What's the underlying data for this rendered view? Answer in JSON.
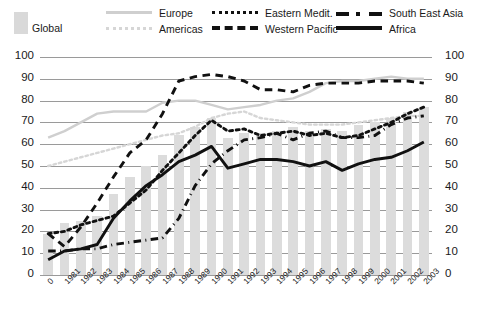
{
  "legend": {
    "global_label": "Global",
    "entries": [
      {
        "name": "Europe",
        "style": "solid-lightgray",
        "color": "#cfcfcf"
      },
      {
        "name": "Eastern Medit.",
        "style": "dotted-black",
        "color": "#111111"
      },
      {
        "name": "South East Asia",
        "style": "dash-dot-black",
        "color": "#111111"
      },
      {
        "name": "Americas",
        "style": "dotted-lightgray",
        "color": "#d6d6d6"
      },
      {
        "name": "Western Pacific",
        "style": "dashed-black",
        "color": "#111111"
      },
      {
        "name": "Africa",
        "style": "solid-black",
        "color": "#111111"
      }
    ]
  },
  "axis": {
    "y_ticks": [
      "100",
      "90",
      "80",
      "70",
      "60",
      "50",
      "40",
      "30",
      "20",
      "10",
      "0"
    ],
    "y_ticks_right": [
      "100",
      "90",
      "80",
      "70",
      "60",
      "50",
      "40",
      "30",
      "20",
      "10",
      "0"
    ],
    "x_ticks": [
      "0",
      "1981",
      "1982",
      "1983",
      "1984",
      "1985",
      "1986",
      "1987",
      "1988",
      "1989",
      "1990",
      "1991",
      "1992",
      "1993",
      "1994",
      "1995",
      "1996",
      "1997",
      "1998",
      "1999",
      "2000",
      "2001",
      "2002",
      "2003"
    ]
  },
  "chart_data": {
    "type": "bar",
    "title": "",
    "subtitle": "",
    "xlabel": "",
    "ylabel": "",
    "ylim": [
      0,
      100
    ],
    "grid": true,
    "legend_position": "top",
    "categories": [
      "1980",
      "1981",
      "1982",
      "1983",
      "1984",
      "1985",
      "1986",
      "1987",
      "1988",
      "1989",
      "1990",
      "1991",
      "1992",
      "1993",
      "1994",
      "1995",
      "1996",
      "1997",
      "1998",
      "1999",
      "2000",
      "2001",
      "2002",
      "2003"
    ],
    "bar_series": {
      "name": "Global",
      "color": "#dcdcdc",
      "values": [
        19,
        24,
        25,
        27,
        37,
        45,
        50,
        55,
        64,
        68,
        72,
        63,
        65,
        65,
        66,
        68,
        66,
        67,
        66,
        69,
        70,
        72,
        75,
        77
      ]
    },
    "series": [
      {
        "name": "Europe",
        "color": "#cfcfcf",
        "style": "solid",
        "values": [
          63,
          66,
          70,
          74,
          75,
          75,
          75,
          79,
          80,
          80,
          78,
          76,
          77,
          78,
          80,
          81,
          84,
          88,
          89,
          89,
          90,
          91,
          90,
          90
        ]
      },
      {
        "name": "Americas",
        "color": "#d6d6d6",
        "style": "dotted",
        "values": [
          50,
          52,
          54,
          56,
          58,
          60,
          62,
          64,
          65,
          68,
          72,
          74,
          75,
          72,
          71,
          70,
          69,
          69,
          69,
          70,
          71,
          72,
          73,
          73
        ]
      },
      {
        "name": "Eastern Medit.",
        "color": "#111111",
        "style": "dotted",
        "values": [
          19,
          20,
          23,
          25,
          27,
          33,
          39,
          48,
          56,
          64,
          71,
          66,
          67,
          64,
          65,
          66,
          64,
          65,
          63,
          64,
          67,
          70,
          74,
          77
        ]
      },
      {
        "name": "Western Pacific",
        "color": "#111111",
        "style": "dashed",
        "values": [
          19,
          13,
          22,
          33,
          45,
          56,
          62,
          74,
          89,
          91,
          92,
          91,
          89,
          85,
          85,
          84,
          87,
          88,
          88,
          88,
          89,
          89,
          89,
          88
        ]
      },
      {
        "name": "South East Asia",
        "color": "#111111",
        "style": "dashdot",
        "values": [
          11,
          11,
          12,
          12,
          14,
          15,
          16,
          17,
          26,
          41,
          51,
          57,
          62,
          63,
          65,
          62,
          65,
          66,
          63,
          63,
          64,
          69,
          72,
          73
        ]
      },
      {
        "name": "Africa",
        "color": "#111111",
        "style": "solid",
        "values": [
          7,
          11,
          12,
          14,
          26,
          34,
          41,
          46,
          52,
          55,
          59,
          49,
          51,
          53,
          53,
          52,
          50,
          52,
          48,
          51,
          53,
          54,
          57,
          61
        ]
      }
    ]
  }
}
